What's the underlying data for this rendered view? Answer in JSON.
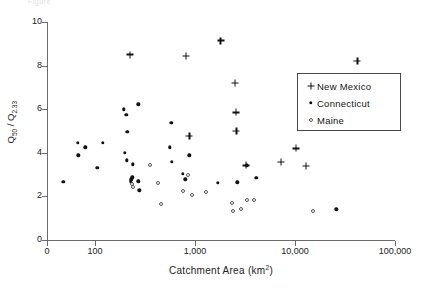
{
  "figure": {
    "top_note": "Figure"
  },
  "chart_data": {
    "type": "scatter",
    "title": "",
    "xlabel": "Catchment Area (km2)",
    "xlabel_parts": {
      "text": "Catchment  Area  (km",
      "sup": "2",
      "tail": ")"
    },
    "ylabel": "Q50 / Q2.33",
    "ylabel_parts": {
      "q1": "Q",
      "sub1": "50",
      "slash": " / ",
      "q2": "Q",
      "sub2": "2.33"
    },
    "xscale": "log",
    "yscale": "linear",
    "xlim": [
      10,
      100000
    ],
    "ylim": [
      0,
      10
    ],
    "xticks": [
      0,
      100,
      1000,
      10000,
      100000
    ],
    "xticklabels": [
      "0",
      "100",
      "1,000",
      "10,000",
      "100,000"
    ],
    "yticks": [
      0,
      2,
      4,
      6,
      8,
      10
    ],
    "yticklabels": [
      "0",
      "2",
      "4",
      "6",
      "8",
      "10"
    ],
    "grid": false,
    "legend_position": "upper right",
    "series": [
      {
        "name": "New Mexico",
        "marker": "plus",
        "color": "#111111",
        "points": [
          [
            225,
            8.5
          ],
          [
            810,
            8.45
          ],
          [
            1800,
            9.15
          ],
          [
            2500,
            7.2
          ],
          [
            2560,
            5.85
          ],
          [
            2600,
            5.0
          ],
          [
            880,
            4.78
          ],
          [
            3250,
            3.42
          ],
          [
            7200,
            3.58
          ],
          [
            10300,
            4.2
          ],
          [
            12800,
            3.4
          ],
          [
            42000,
            8.2
          ]
        ]
      },
      {
        "name": "Connecticut",
        "marker": "dot",
        "color": "#111111",
        "points": [
          [
            48,
            2.68
          ],
          [
            67,
            4.45
          ],
          [
            68,
            3.88
          ],
          [
            80,
            4.25
          ],
          [
            105,
            3.3
          ],
          [
            120,
            4.45
          ],
          [
            195,
            6.0
          ],
          [
            205,
            5.75
          ],
          [
            210,
            4.95
          ],
          [
            200,
            4.0
          ],
          [
            208,
            3.65
          ],
          [
            240,
            3.48
          ],
          [
            237,
            2.88
          ],
          [
            230,
            2.78
          ],
          [
            228,
            2.7
          ],
          [
            270,
            2.7
          ],
          [
            272,
            6.22
          ],
          [
            278,
            2.28
          ],
          [
            560,
            4.25
          ],
          [
            580,
            5.38
          ],
          [
            590,
            3.6
          ],
          [
            760,
            3.05
          ],
          [
            800,
            2.78
          ],
          [
            880,
            3.88
          ],
          [
            1700,
            2.62
          ],
          [
            2650,
            2.65
          ],
          [
            3300,
            3.42
          ],
          [
            4100,
            2.85
          ],
          [
            26000,
            1.4
          ]
        ]
      },
      {
        "name": "Maine",
        "marker": "circle",
        "color": "#555555",
        "points": [
          [
            232,
            2.55
          ],
          [
            238,
            2.42
          ],
          [
            355,
            3.42
          ],
          [
            430,
            2.6
          ],
          [
            460,
            1.65
          ],
          [
            760,
            2.25
          ],
          [
            860,
            3.0
          ],
          [
            930,
            2.05
          ],
          [
            1300,
            2.22
          ],
          [
            2350,
            1.7
          ],
          [
            2380,
            1.35
          ],
          [
            2900,
            1.42
          ],
          [
            3300,
            1.82
          ],
          [
            3900,
            1.85
          ],
          [
            15000,
            1.35
          ]
        ]
      }
    ]
  },
  "legend": {
    "items": [
      {
        "label": "New  Mexico",
        "marker": "plus"
      },
      {
        "label": "Connecticut",
        "marker": "dot"
      },
      {
        "label": "Maine",
        "marker": "circle"
      }
    ]
  }
}
